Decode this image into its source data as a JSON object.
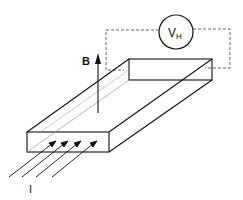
{
  "diagram": {
    "labels": {
      "magnetic_field": "B",
      "voltmeter_main": "V",
      "voltmeter_sub": "H",
      "current": "I"
    },
    "colors": {
      "stroke": "#111111",
      "dashed": "#555555",
      "inner_line": "#888888",
      "background": "#ffffff"
    },
    "elements": [
      "voltmeter-circle",
      "dashed-circuit-wire",
      "conductor-slab",
      "magnetic-field-arrow",
      "current-arrows"
    ]
  }
}
